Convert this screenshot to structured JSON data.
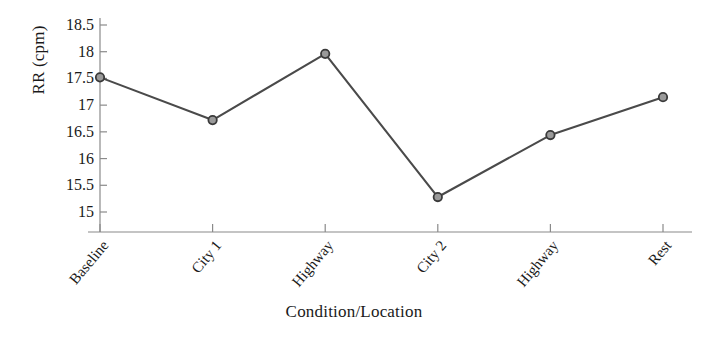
{
  "chart_data": {
    "type": "line",
    "title": "",
    "xlabel": "Condition/Location",
    "ylabel": "RR (cpm)",
    "categories": [
      "Baseline",
      "City 1",
      "Highway",
      "City 2",
      "Highway",
      "Rest"
    ],
    "values": [
      17.52,
      16.72,
      17.96,
      15.28,
      16.44,
      17.15
    ],
    "series": [
      {
        "name": "RR (cpm)",
        "values": [
          17.52,
          16.72,
          17.96,
          15.28,
          16.44,
          17.15
        ]
      }
    ],
    "ylim": [
      14.72,
      18.78
    ],
    "yticks": [
      "15",
      "15.5",
      "16",
      "16.5",
      "17",
      "17.5",
      "18",
      "18.5"
    ],
    "ytick_values": [
      15,
      15.5,
      16,
      16.5,
      17,
      17.5,
      18,
      18.5
    ],
    "grid": false,
    "legend": "none",
    "marker": "circle-open",
    "line_color": "#4a4a4a",
    "marker_face_color": "#9a9a9a",
    "marker_edge_color": "#3a3a3a",
    "axis_color": "#8a8a8a",
    "text_color": "#1a1a1a"
  }
}
